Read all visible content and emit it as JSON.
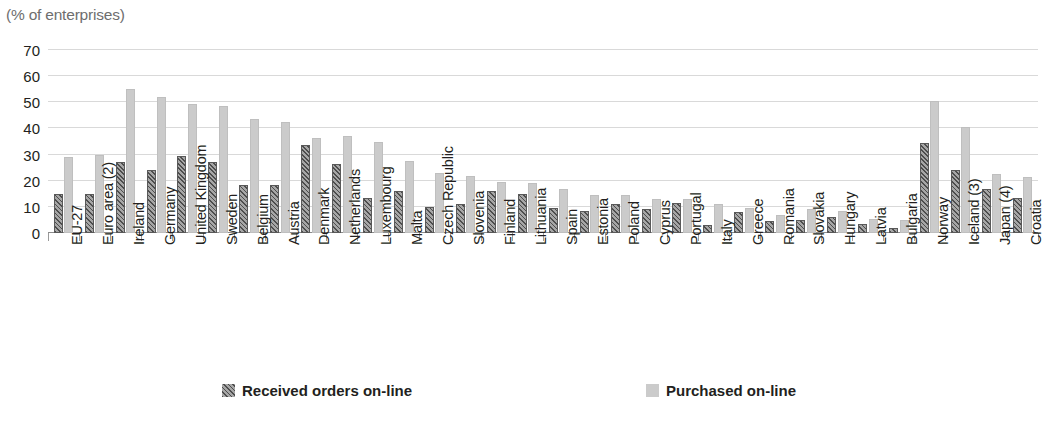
{
  "header": {
    "title_remnant": "",
    "subtitle": "(% of enterprises)"
  },
  "legend": {
    "items": [
      {
        "label": "Received orders on-line",
        "key": "received",
        "color": "#8a8a8a"
      },
      {
        "label": "Purchased on-line",
        "key": "purchased",
        "color": "#cbcbcb"
      }
    ]
  },
  "chart_data": {
    "type": "bar",
    "title": "",
    "subtitle": "(% of enterprises)",
    "xlabel": "",
    "ylabel": "",
    "ylim": [
      0,
      70
    ],
    "yticks": [
      0,
      10,
      20,
      30,
      40,
      50,
      60,
      70
    ],
    "grid": true,
    "legend_position": "bottom",
    "categories": [
      "EU-27",
      "Euro area (2)",
      "Ireland",
      "Germany",
      "United Kingdom",
      "Sweden",
      "Belgium",
      "Austria",
      "Denmark",
      "Netherlands",
      "Luxembourg",
      "Malta",
      "Czech Republic",
      "Slovenia",
      "Finland",
      "Lithuania",
      "Spain",
      "Estonia",
      "Poland",
      "Cyprus",
      "Portugal",
      "Italy",
      "Greece",
      "Romania",
      "Slovakia",
      "Hungary",
      "Latvia",
      "Bulgaria",
      "Norway",
      "Iceland (3)",
      "Japan (4)",
      "Croatia"
    ],
    "series": [
      {
        "name": "Received orders on-line",
        "color": "#8a8a8a",
        "values": [
          15,
          15,
          27,
          24,
          29.5,
          27,
          18.5,
          18.5,
          33.5,
          26.5,
          13.5,
          16,
          10,
          11,
          16,
          15,
          9.5,
          8.5,
          11,
          9,
          11.5,
          3,
          8,
          4.5,
          5,
          6,
          3.5,
          2,
          34.5,
          24,
          17,
          13.5
        ]
      },
      {
        "name": "Purchased on-line",
        "color": "#cbcbcb",
        "values": [
          29,
          30,
          55,
          52,
          49.5,
          48.5,
          43.5,
          42.5,
          36.5,
          37,
          35,
          27.5,
          23,
          22,
          19.5,
          19,
          17,
          14.5,
          14.5,
          13,
          13,
          11,
          9.5,
          7,
          9,
          8.5,
          5.5,
          5,
          50.5,
          40.5,
          22.5,
          21.5
        ]
      }
    ]
  }
}
